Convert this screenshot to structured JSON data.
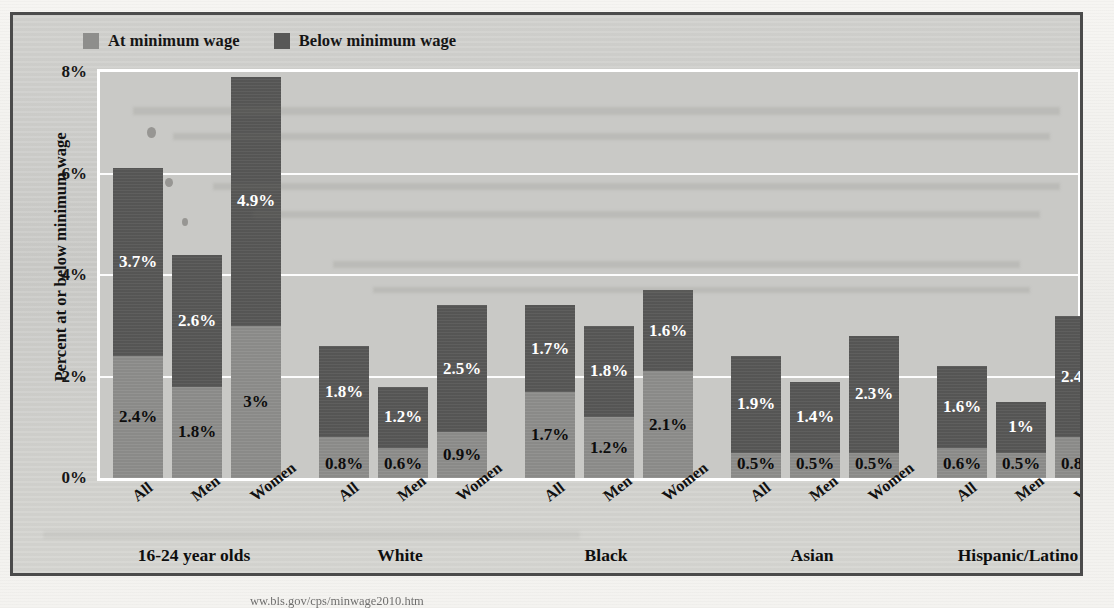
{
  "figure": {
    "ylabel": "Percent at or below minimum wage",
    "yticks": [
      "0%",
      "2%",
      "4%",
      "6%",
      "8%"
    ],
    "legend": [
      {
        "label": "At minimum wage",
        "color": "#8e8e8c",
        "key": "at"
      },
      {
        "label": "Below minimum wage",
        "color": "#585857",
        "key": "below"
      }
    ],
    "footer_caption": "ww.bls.gov/cps/minwage2010.htm"
  },
  "colors": {
    "at_minimum_wage": "#8e8e8c",
    "below_minimum_wage": "#585857",
    "plot_background": "#c9c9c6",
    "figure_background": "#cfcfcc",
    "frame": "#4b4b4b",
    "gridline": "#ffffff"
  },
  "chart_data": {
    "type": "bar",
    "subtype": "stacked",
    "title": "",
    "xlabel": "",
    "ylabel": "Percent at or below minimum wage",
    "ylim": [
      0,
      8
    ],
    "yticks": [
      0,
      2,
      4,
      6,
      8
    ],
    "ytick_labels": [
      "0%",
      "2%",
      "4%",
      "6%",
      "8%"
    ],
    "grid": true,
    "legend_position": "top-left",
    "categories": [
      "All",
      "Men",
      "Women",
      "All",
      "Men",
      "Women",
      "All",
      "Men",
      "Women",
      "All",
      "Men",
      "Women",
      "All",
      "Men",
      "Women"
    ],
    "groups": [
      {
        "name": "16-24 year olds",
        "categories": [
          "All",
          "Men",
          "Women"
        ]
      },
      {
        "name": "White",
        "categories": [
          "All",
          "Men",
          "Women"
        ]
      },
      {
        "name": "Black",
        "categories": [
          "All",
          "Men",
          "Women"
        ]
      },
      {
        "name": "Asian",
        "categories": [
          "All",
          "Men",
          "Women"
        ]
      },
      {
        "name": "Hispanic/Latino",
        "categories": [
          "All",
          "Men",
          "Women"
        ]
      }
    ],
    "series": [
      {
        "name": "At minimum wage",
        "color": "#8e8e8c",
        "values": [
          2.4,
          1.8,
          3.0,
          0.8,
          0.6,
          0.9,
          1.7,
          1.2,
          2.1,
          0.5,
          0.5,
          0.5,
          0.6,
          0.5,
          0.8
        ],
        "labels": [
          "2.4%",
          "1.8%",
          "3%",
          "0.8%",
          "0.6%",
          "0.9%",
          "1.7%",
          "1.2%",
          "2.1%",
          "0.5%",
          "0.5%",
          "0.5%",
          "0.6%",
          "0.5%",
          "0.8%"
        ]
      },
      {
        "name": "Below minimum wage",
        "color": "#585857",
        "values": [
          3.7,
          2.6,
          4.9,
          1.8,
          1.2,
          2.5,
          1.7,
          1.8,
          1.6,
          1.9,
          1.4,
          2.3,
          1.6,
          1.0,
          2.4
        ],
        "labels": [
          "3.7%",
          "2.6%",
          "4.9%",
          "1.8%",
          "1.2%",
          "2.5%",
          "1.7%",
          "1.8%",
          "1.6%",
          "1.9%",
          "1.4%",
          "2.3%",
          "1.6%",
          "1%",
          "2.4%"
        ]
      }
    ],
    "totals": [
      6.1,
      4.4,
      7.9,
      2.6,
      1.8,
      3.4,
      3.4,
      3.0,
      3.7,
      2.4,
      1.9,
      2.8,
      2.2,
      1.5,
      3.2
    ]
  }
}
